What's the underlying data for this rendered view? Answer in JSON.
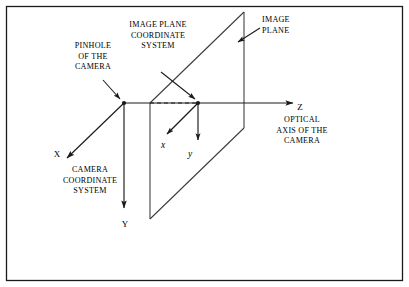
{
  "figure": {
    "background_color": "#ffffff",
    "border_color": "#1a1a1a",
    "ink_color": "#1a1a1a"
  },
  "labels": {
    "pinhole": {
      "name": "pinhole-of-the-camera-label",
      "lines": [
        "PINHOLE",
        "OF THE",
        "CAMERA"
      ],
      "line1": "PINHOLE",
      "line2": "OF THE",
      "line3": "CAMERA",
      "align": "center"
    },
    "image_plane_cs": {
      "name": "image-plane-coordinate-system-label",
      "lines": [
        "IMAGE  PLANE",
        "COORDINATE",
        "SYSTEM"
      ],
      "line1": "IMAGE  PLANE",
      "line2": "COORDINATE",
      "line3": "SYSTEM",
      "align": "center"
    },
    "image_plane": {
      "name": "image-plane-label",
      "lines": [
        "IMAGE",
        "PLANE"
      ],
      "line1": "IMAGE",
      "line2": "PLANE",
      "align": "left"
    },
    "camera_cs": {
      "name": "camera-coordinate-system-label",
      "lines": [
        "CAMERA",
        "COORDINATE",
        "SYSTEM"
      ],
      "line1": "CAMERA",
      "line2": "COORDINATE",
      "line3": "SYSTEM",
      "align": "center"
    },
    "optical_axis": {
      "name": "optical-axis-of-the-camera-label",
      "lines": [
        "OPTICAL",
        "AXIS OF THE",
        "CAMERA"
      ],
      "line1": "OPTICAL",
      "line2": "AXIS OF THE",
      "line3": "CAMERA",
      "align": "center"
    }
  },
  "axes": {
    "camera": {
      "x": {
        "label": "X",
        "direction": "down-left",
        "origin": "pinhole"
      },
      "y": {
        "label": "Y",
        "direction": "down",
        "origin": "pinhole"
      },
      "z": {
        "label": "Z",
        "direction": "right",
        "origin": "pinhole"
      }
    },
    "image_plane": {
      "x": {
        "label": "x",
        "direction": "down-left",
        "origin": "image-plane-origin"
      },
      "y": {
        "label": "y",
        "direction": "down",
        "origin": "image-plane-origin"
      }
    }
  },
  "geometry": {
    "pinhole_point": {
      "x": 124,
      "y": 103
    },
    "image_plane_origin": {
      "x": 198,
      "y": 103
    },
    "image_plane_quad": [
      {
        "x": 150,
        "y": 103
      },
      {
        "x": 244,
        "y": 12
      },
      {
        "x": 244,
        "y": 128
      },
      {
        "x": 150,
        "y": 219
      }
    ],
    "dashed_segment": {
      "x1": 150,
      "y1": 103,
      "x2": 198,
      "y2": 103
    }
  }
}
